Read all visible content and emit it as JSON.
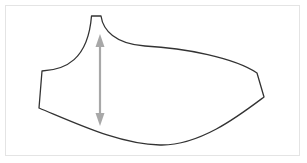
{
  "diagram": {
    "type": "sewing-pattern-piece",
    "colors": {
      "outline": "#333333",
      "arrow": "#a8a8a8",
      "frame": "#e4e4e4",
      "background": "#ffffff"
    },
    "arrow": {
      "orientation": "vertical",
      "x": 100,
      "y_top": 35,
      "y_bottom": 125
    }
  }
}
